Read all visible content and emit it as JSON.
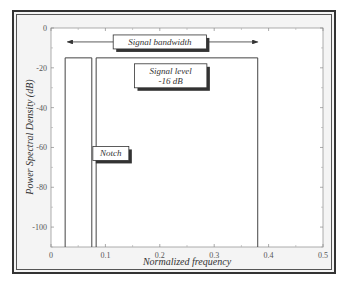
{
  "chart_data": {
    "type": "line",
    "title": "",
    "xlabel": "Normalized frequency",
    "ylabel": "Power Spectral Density (dB)",
    "xlim": [
      0,
      0.5
    ],
    "ylim": [
      -110,
      0
    ],
    "xticks": [
      0,
      0.1,
      0.2,
      0.3,
      0.4,
      0.5
    ],
    "xtick_labels": [
      "0",
      "0.1",
      "0.2",
      "0.3",
      "0.4",
      "0.5"
    ],
    "yticks": [
      0,
      -20,
      -40,
      -60,
      -80,
      -100
    ],
    "ytick_labels": [
      "0",
      "-20",
      "-40",
      "-60",
      "-80",
      "-100"
    ],
    "grid": false,
    "series": [
      {
        "name": "Signal band (lower)",
        "x": [
          0.026,
          0.026,
          0.075,
          0.075
        ],
        "y": [
          -110,
          -15,
          -15,
          -110
        ]
      },
      {
        "name": "Signal band (upper)",
        "x": [
          0.083,
          0.083,
          0.38,
          0.38
        ],
        "y": [
          -110,
          -15,
          -15,
          -110
        ]
      }
    ],
    "annotations": [
      {
        "text": "Signal bandwidth",
        "x": 0.2,
        "y": -7,
        "type": "double-arrow",
        "x_from": 0.03,
        "x_to": 0.38
      },
      {
        "text": "Signal level",
        "text2": "-16 dB",
        "x": 0.22,
        "y": -22
      },
      {
        "text": "Notch",
        "x": 0.11,
        "y": -63
      }
    ]
  }
}
